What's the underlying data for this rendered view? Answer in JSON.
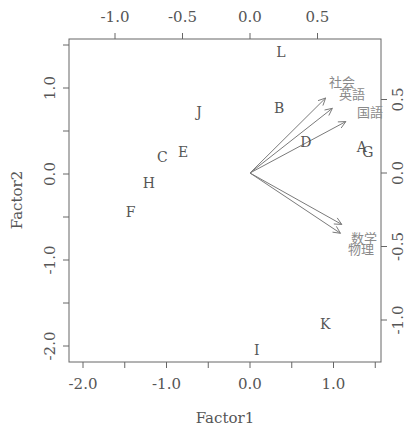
{
  "chart_data": {
    "type": "biplot",
    "title": "",
    "xlabel": "Factor1",
    "ylabel": "Factor2",
    "primary_axes": {
      "x_ticks": [
        -2.0,
        -1.5,
        -1.0,
        -0.5,
        0.0,
        0.5,
        1.0,
        1.5
      ],
      "x_tick_labels": [
        "-2.0",
        "",
        "-1.0",
        "",
        "0.0",
        "",
        "1.0",
        ""
      ],
      "y_ticks": [
        1.5,
        1.0,
        0.5,
        0.0,
        -0.5,
        -1.0,
        -1.5,
        -2.0
      ],
      "y_tick_labels": [
        "",
        "1.0",
        "",
        "0.0",
        "",
        "-1.0",
        "",
        "-2.0"
      ],
      "xlim": [
        -2.2,
        1.57
      ],
      "ylim": [
        -2.1,
        1.57
      ]
    },
    "secondary_axes": {
      "top_ticks": [
        -1.0,
        -0.5,
        0.0,
        0.5
      ],
      "top_tick_labels": [
        "-1.0",
        "-0.5",
        "0.0",
        "0.5"
      ],
      "right_ticks": [
        0.5,
        0.0,
        -0.5,
        -1.0
      ],
      "right_tick_labels": [
        "0.5",
        "0.0",
        "-0.5",
        "-1.0"
      ]
    },
    "observations": [
      {
        "label": "A",
        "x": 1.34,
        "y": 0.31
      },
      {
        "label": "B",
        "x": 0.35,
        "y": 0.77
      },
      {
        "label": "C",
        "x": -1.05,
        "y": 0.2
      },
      {
        "label": "D",
        "x": 0.67,
        "y": 0.37
      },
      {
        "label": "E",
        "x": -0.8,
        "y": 0.26
      },
      {
        "label": "F",
        "x": -1.43,
        "y": -0.44
      },
      {
        "label": "G",
        "x": 1.41,
        "y": 0.26
      },
      {
        "label": "H",
        "x": -1.21,
        "y": -0.1
      },
      {
        "label": "I",
        "x": 0.08,
        "y": -2.05
      },
      {
        "label": "J",
        "x": -0.61,
        "y": 0.72
      },
      {
        "label": "K",
        "x": 0.9,
        "y": -1.74
      },
      {
        "label": "L",
        "x": 0.37,
        "y": 1.42
      }
    ],
    "loadings": [
      {
        "label": "社会",
        "x": 0.56,
        "y": 0.51
      },
      {
        "label": "英語",
        "x": 0.61,
        "y": 0.44
      },
      {
        "label": "国語",
        "x": 0.71,
        "y": 0.35
      },
      {
        "label": "数学",
        "x": 0.68,
        "y": -0.35
      },
      {
        "label": "物理",
        "x": 0.67,
        "y": -0.41
      }
    ],
    "grid": false,
    "legend": "none",
    "colors": {
      "frame": "#666666",
      "observation_text": "#555555",
      "arrow": "#7a7a7a",
      "loading_text": "#8a8a8a"
    }
  }
}
